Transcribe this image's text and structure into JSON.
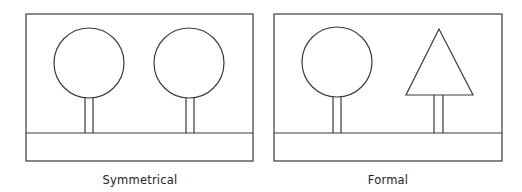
{
  "colors": {
    "stroke": "#3a3a3a",
    "background": "#ffffff",
    "text": "#222222"
  },
  "panels": [
    {
      "caption": "Symmetrical",
      "frame": {
        "x": 26,
        "y": 14,
        "w": 227,
        "h": 147,
        "ground_y": 133
      },
      "trees": [
        {
          "type": "circle",
          "cx": 89,
          "cy": 63,
          "r": 35,
          "trunk_x": 84,
          "trunk_w": 9
        },
        {
          "type": "circle",
          "cx": 189,
          "cy": 63,
          "r": 35,
          "trunk_x": 185,
          "trunk_w": 9
        }
      ]
    },
    {
      "caption": "Formal",
      "frame": {
        "x": 274,
        "y": 14,
        "w": 228,
        "h": 147,
        "ground_y": 133
      },
      "trees": [
        {
          "type": "circle",
          "cx": 337,
          "cy": 62,
          "r": 35,
          "trunk_x": 333,
          "trunk_w": 8
        },
        {
          "type": "triangle",
          "apex_x": 439,
          "apex_y": 29,
          "base_y": 95,
          "base_left": 406,
          "base_right": 473,
          "trunk_x": 434,
          "trunk_w": 9
        }
      ]
    }
  ]
}
